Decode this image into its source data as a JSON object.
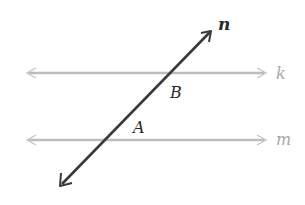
{
  "diagram": {
    "colors": {
      "background": "#ffffff",
      "parallel_lines": "#bdbdbd",
      "transversal": "#3a3a3a",
      "parallel_labels": "#a8a8a8",
      "point_labels": "#2a2a2a"
    },
    "lines": [
      {
        "id": "k",
        "label": "k",
        "type": "parallel",
        "x1": 25,
        "y1": 73,
        "x2": 268,
        "y2": 73
      },
      {
        "id": "m",
        "label": "m",
        "type": "parallel",
        "x1": 25,
        "y1": 140,
        "x2": 268,
        "y2": 140
      },
      {
        "id": "n",
        "label": "n",
        "type": "transversal",
        "x1": 60,
        "y1": 186,
        "x2": 212,
        "y2": 30
      }
    ],
    "labels": {
      "n": "n",
      "k": "k",
      "m": "m",
      "B": "B",
      "A": "A"
    },
    "points": [
      {
        "name": "B",
        "description": "angle at intersection of n and k, below k right of n"
      },
      {
        "name": "A",
        "description": "angle at intersection of n and m, above m right of n"
      }
    ]
  }
}
